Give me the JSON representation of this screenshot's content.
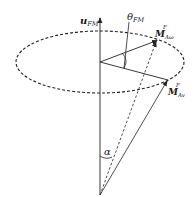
{
  "diagram": {
    "type": "vector-cone-diagram",
    "stroke_color": "#222222",
    "labels": {
      "axis_vector": {
        "base": "u",
        "sub": "FM"
      },
      "theta": {
        "base": "θ",
        "sub": "FM"
      },
      "vector_omega": {
        "base": "M",
        "sub": "Aω",
        "sup": "F"
      },
      "vector_v": {
        "base": "M",
        "sub": "Av",
        "sup": "F"
      },
      "alpha": "α"
    },
    "elements": [
      "vertical axis arrow u_FM",
      "dashed ellipse (circular trajectory)",
      "arrow from center to M^F_Aω",
      "arrow from center to M^F_Av",
      "dashed line from apex to M^F_Aω",
      "solid arrow from apex to M^F_Av",
      "angle θ_FM arc between the two in-plane vectors",
      "angle α arc at apex"
    ]
  }
}
